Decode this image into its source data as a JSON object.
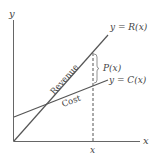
{
  "diagram": {
    "axes": {
      "x_label": "x",
      "y_label": "y"
    },
    "lines": [
      {
        "name": "revenue",
        "label": "Revenue",
        "equation": "y = R(x)"
      },
      {
        "name": "cost",
        "label": "Cost",
        "equation": "y = C(x)"
      }
    ],
    "profit_label": "P(x)",
    "x_marker_label": "x",
    "colors": {
      "line": "#555555",
      "text": "#444444",
      "background": "#ffffff"
    }
  }
}
